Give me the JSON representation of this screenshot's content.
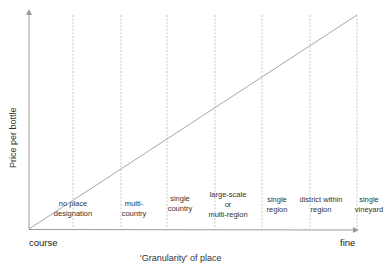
{
  "diagram": {
    "y_axis_label": "Price per bottle",
    "x_axis_label": "'Granularity' of place",
    "x_start_label": "course",
    "x_end_label": "fine",
    "colors": {
      "axis": "#9a9a9a",
      "trend_line": "#a8a8a8",
      "dashed_lines": "#c8c8c8",
      "text": "#333333"
    },
    "categories": [
      {
        "line1": "no place",
        "line2": "designation",
        "line3": ""
      },
      {
        "line1": "multi-",
        "line2": "country",
        "line3": ""
      },
      {
        "line1": "single",
        "line2": "country",
        "line3": ""
      },
      {
        "line1": "large-scale",
        "line2": "or",
        "line3": "multi-region"
      },
      {
        "line1": "single",
        "line2": "region",
        "line3": ""
      },
      {
        "line1": "district within",
        "line2": "region",
        "line3": ""
      },
      {
        "line1": "single",
        "line2": "vineyard",
        "line3": ""
      }
    ],
    "trend": "Price increases linearly as granularity of place goes from course to fine"
  }
}
